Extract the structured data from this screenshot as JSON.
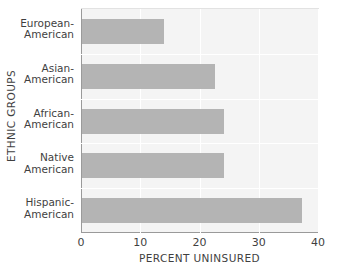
{
  "chart_data": {
    "type": "bar",
    "orientation": "horizontal",
    "title": "",
    "xlabel": "PERCENT UNINSURED",
    "ylabel": "ETHNIC GROUPS",
    "categories": [
      "European-\nAmerican",
      "Asian-\nAmerican",
      "African-\nAmerican",
      "Native\nAmerican",
      "Hispanic-\nAmerican"
    ],
    "category_lines": [
      [
        "European-",
        "American"
      ],
      [
        "Asian-",
        "American"
      ],
      [
        "African-",
        "American"
      ],
      [
        "Native",
        "American"
      ],
      [
        "Hispanic-",
        "American"
      ]
    ],
    "values": [
      13.8,
      22.5,
      24.0,
      24.0,
      37.2
    ],
    "xlim": [
      0,
      40
    ],
    "xticks": [
      0,
      10,
      20,
      30,
      40
    ],
    "xtick_labels": [
      "0",
      "10",
      "20",
      "30",
      "40"
    ],
    "grid": true,
    "legend": false,
    "bar_color": "#b4b4b4",
    "panel_color": "#f4f4f4",
    "grid_color": "#ffffff",
    "axis_color": "#9a9a9a",
    "text_color": "#3f3f3f"
  }
}
